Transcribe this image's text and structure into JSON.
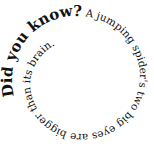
{
  "spiral": {
    "heading": "Did you know?",
    "body": " A jumping spider's two big eyes are bigger than its brain.",
    "text_color": "#111111",
    "background": "#ffffff"
  }
}
